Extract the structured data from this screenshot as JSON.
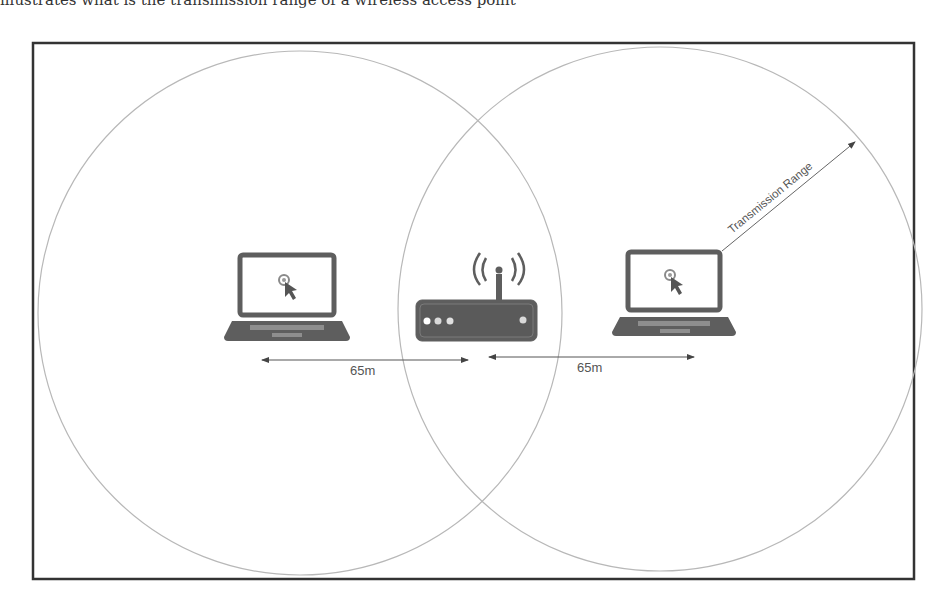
{
  "page": {
    "cropped_header_text": "illustrates what is the transmission range of a wireless access point"
  },
  "diagram": {
    "title": "Transmission range of a wireless access point",
    "colors": {
      "frame": "#333333",
      "circle": "#b5b5b5",
      "device": "#5e5e5e",
      "arrow": "#555555",
      "text": "#555555"
    },
    "left_laptop": {
      "label": "Laptop"
    },
    "router": {
      "label": "Wireless router"
    },
    "right_laptop": {
      "label": "Laptop"
    },
    "distances": [
      {
        "label": "65m",
        "from": "left-laptop",
        "to": "router"
      },
      {
        "label": "65m",
        "from": "router",
        "to": "right-laptop"
      }
    ],
    "range_label": "Transmission Range"
  }
}
